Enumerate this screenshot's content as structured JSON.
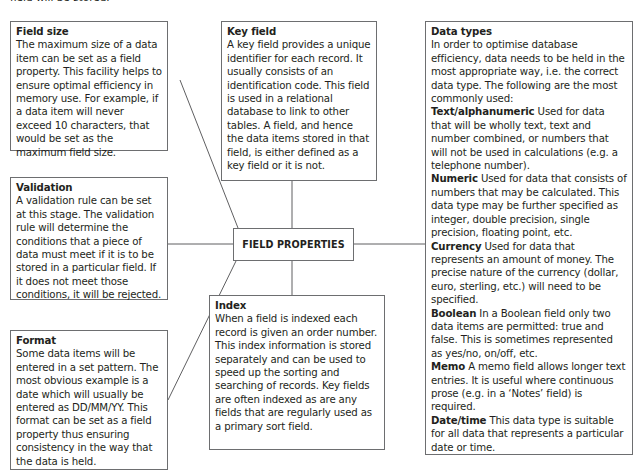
{
  "intro": {
    "text": "field will be stored."
  },
  "center": {
    "label": "FIELD PROPERTIES"
  },
  "boxes": {
    "field_size": {
      "title": "Field size",
      "body": "The maximum size of a data item can be set as a field property. This facility helps to ensure optimal efficiency in memory use. For example, if a data item will never exceed 10 characters, that would be set as the maximum field size."
    },
    "validation": {
      "title": "Validation",
      "body": "A validation rule can be set at this stage. The validation rule will determine the conditions that a piece of data must meet if it is to be stored in a particular field. If it does not meet those conditions, it will be rejected."
    },
    "format": {
      "title": "Format",
      "body": "Some data items will be entered in a set pattern. The most obvious example is a date which will usually be entered as DD/MM/YY. This format can be set as a field property thus ensuring consistency in the way that the data is held."
    },
    "key_field": {
      "title": "Key field",
      "body": "A key field provides a unique identifier for each record. It usually consists of an identification code. This field is used in a relational database to link to other tables. A field, and hence the data items stored in that field, is either defined as a key field or it is not."
    },
    "index": {
      "title": "Index",
      "body": "When a field is indexed each record is given an order number. This index information is stored separately and can be used to speed up the sorting and searching of records. Key fields are often indexed as are any fields that are regularly used as a primary sort field."
    },
    "data_types": {
      "title": "Data types",
      "body": "In order to optimise database efficiency, data needs to be held in the most appropriate way, i.e. the correct data type. The following are the most commonly used:",
      "items": [
        {
          "term": "Text/alphanumeric",
          "desc": " Used for data that will be wholly text, text and number combined, or numbers that will not be used in calculations (e.g. a telephone number)."
        },
        {
          "term": "Numeric",
          "desc": " Used for data that consists of numbers that may be calculated. This data type may be further specified as integer, double precision, single precision, floating point, etc."
        },
        {
          "term": "Currency",
          "desc": " Used for data that represents an amount of money. The precise nature of the currency (dollar, euro, sterling, etc.) will need to be specified."
        },
        {
          "term": "Boolean",
          "desc": " In a Boolean field only two data items are permitted: true and false. This is sometimes represented as yes/no, on/off, etc."
        },
        {
          "term": "Memo",
          "desc": " A memo field allows longer text entries. It is useful where continuous prose (e.g. in a ‘Notes’ field) is required."
        },
        {
          "term": "Date/time",
          "desc": " This data type is suitable for all data that represents a particular date or time."
        }
      ]
    }
  },
  "colors": {
    "border": "#6d6e70",
    "text": "#231f20",
    "connector": "#4d4d4f"
  }
}
